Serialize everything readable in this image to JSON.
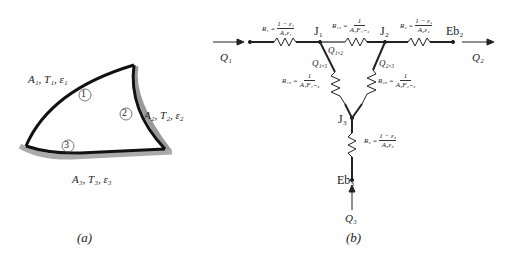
{
  "panel_a": {
    "caption": "(a)",
    "surfaces": [
      {
        "id": "1",
        "label": "A₁, T₁, ε₁"
      },
      {
        "id": "2",
        "label": "A₂, T₂, ε₂"
      },
      {
        "id": "3",
        "label": "A₃, T₃, ε₃"
      }
    ]
  },
  "panel_b": {
    "caption": "(b)",
    "nodes": {
      "J1": "J₁",
      "J2": "J₂",
      "J3": "J₃",
      "Eb2": "Eb₂",
      "Eb3": "Eb₃"
    },
    "flows": {
      "Q1": "Q₁",
      "Q2": "Q₂",
      "Q3": "Q₃",
      "Q12": "Q₁,₂",
      "Q13": "Q₁,₃",
      "Q23": "Q₂,₃"
    },
    "resistors": {
      "R1": {
        "name": "R₁ =",
        "num": "1 − ε₁",
        "den": "A₁ε₁"
      },
      "R12": {
        "name": "R₁₂ =",
        "num": "1",
        "den": "A₁F₁₋₂"
      },
      "R2": {
        "name": "R₂ =",
        "num": "1 − ε₂",
        "den": "A₂ε₂"
      },
      "R13": {
        "name": "R₁₃ =",
        "num": "1",
        "den": "A₁F₁₋₃"
      },
      "R23": {
        "name": "R₂₃ =",
        "num": "1",
        "den": "A₂F₂₋₃"
      },
      "R3": {
        "name": "R₃ =",
        "num": "1 − ε₃",
        "den": "A₃ε₃"
      }
    }
  }
}
